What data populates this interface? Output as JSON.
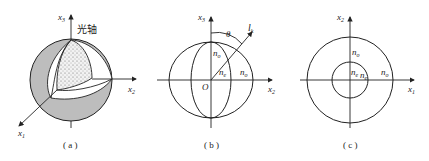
{
  "figure": {
    "panels": [
      {
        "id": "a",
        "caption": "( a )",
        "axes": {
          "vertical": "x3",
          "horizontal": "x2",
          "diagonal": "x1"
        },
        "axis_labels": {
          "x3": "x",
          "x3_sub": "3",
          "x2": "x",
          "x2_sub": "2",
          "x1": "x",
          "x1_sub": "1"
        },
        "annotation": "光轴",
        "description": "Index ellipsoid (sphere cut-away) with optical axis along x3"
      },
      {
        "id": "b",
        "caption": "( b )",
        "axis_labels": {
          "x3": "x",
          "x3_sub": "3",
          "x2": "x",
          "x2_sub": "2"
        },
        "origin": "O",
        "angle": "θ",
        "wave_vector": "l",
        "wave_vector_sub": "k",
        "indices": {
          "no_top": "n",
          "no_top_sub": "o",
          "ne": "n",
          "ne_sub": "e",
          "no_right": "n",
          "no_right_sub": "o"
        }
      },
      {
        "id": "c",
        "caption": "( c )",
        "axis_labels": {
          "x2": "x",
          "x2_sub": "2",
          "x1": "x",
          "x1_sub": "1"
        },
        "indices": {
          "no_top": "n",
          "no_top_sub": "o",
          "inner_left": "n",
          "inner_left_sub": "e",
          "inner_right": "n",
          "inner_right_sub": "e",
          "no_right": "n",
          "no_right_sub": "o"
        }
      }
    ],
    "colors": {
      "line": "#222222",
      "shade": "#bdbdbd",
      "dots": "#555555",
      "background": "#ffffff"
    }
  }
}
